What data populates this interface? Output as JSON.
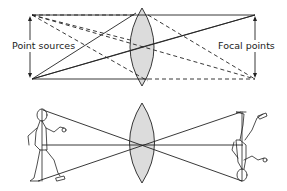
{
  "figure": {
    "top_diagram": {
      "labels": {
        "left": "Point sources",
        "right": "Focal points"
      },
      "lens_fill": "#dcdcdc"
    },
    "bottom_diagram": {
      "lens_fill": "#dcdcdc",
      "description": "Upright figure on left imaged inverted on right through convex lens"
    }
  }
}
